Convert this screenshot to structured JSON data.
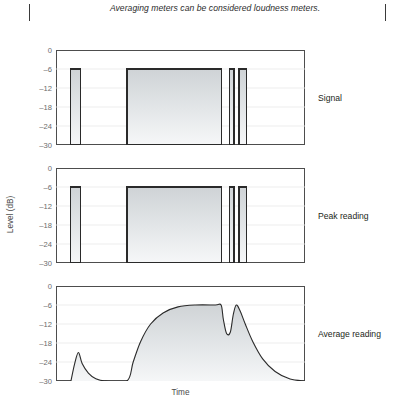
{
  "caption": {
    "text": "Averaging meters can be considered loudness meters."
  },
  "figure": {
    "y_axis_title": "Level (dB)",
    "x_axis_title": "Time",
    "y_ticks": [
      "0",
      "-6",
      "-12",
      "-18",
      "-24",
      "-30"
    ],
    "panels": [
      {
        "id": "signal",
        "label": "Signal"
      },
      {
        "id": "peak",
        "label": "Peak reading"
      },
      {
        "id": "average",
        "label": "Average reading"
      }
    ]
  },
  "colors": {
    "frame": "#4d4d4d",
    "gridline": "#e8e8e8",
    "fill_top": "#cfd3d6",
    "fill_bottom": "#f6f7f8",
    "curve": "#2a2a2a",
    "tick_text": "#6b6b6b",
    "label_text": "#231f20"
  },
  "chart_data": [
    {
      "type": "area",
      "title": "Signal",
      "xlabel": "Time",
      "ylabel": "Level (dB)",
      "ylim": [
        -30,
        0
      ],
      "yticks": [
        0,
        -6,
        -12,
        -18,
        -24,
        -30
      ],
      "grid": true,
      "legend": "none",
      "note": "Rectangular signal bursts all at -6 dB, drawn as blocks from the -30 dB baseline.",
      "blocks": [
        {
          "x_start": 0.06,
          "x_end": 0.1,
          "level_db": -6
        },
        {
          "x_start": 0.285,
          "x_end": 0.665,
          "level_db": -6
        },
        {
          "x_start": 0.695,
          "x_end": 0.715,
          "level_db": -6
        },
        {
          "x_start": 0.735,
          "x_end": 0.765,
          "level_db": -6
        }
      ]
    },
    {
      "type": "area",
      "title": "Peak reading",
      "xlabel": "Time",
      "ylabel": "Level (dB)",
      "ylim": [
        -30,
        0
      ],
      "yticks": [
        0,
        -6,
        -12,
        -18,
        -24,
        -30
      ],
      "grid": true,
      "legend": "none",
      "note": "Peak meter tracks the signal exactly: same blocks at -6 dB.",
      "blocks": [
        {
          "x_start": 0.06,
          "x_end": 0.1,
          "level_db": -6
        },
        {
          "x_start": 0.285,
          "x_end": 0.665,
          "level_db": -6
        },
        {
          "x_start": 0.695,
          "x_end": 0.715,
          "level_db": -6
        },
        {
          "x_start": 0.735,
          "x_end": 0.765,
          "level_db": -6
        }
      ]
    },
    {
      "type": "area",
      "title": "Average reading",
      "xlabel": "Time",
      "ylabel": "Level (dB)",
      "ylim": [
        -30,
        0
      ],
      "yticks": [
        0,
        -6,
        -12,
        -18,
        -24,
        -30
      ],
      "grid": true,
      "legend": "none",
      "note": "Averaging meter: smooth attack/decay envelope. Short burst only reaches about -21 dB; long burst settles at -6 dB; brief dip to about -15 dB between the last bursts, then a slow decay to -30 dB.",
      "x": [
        0.06,
        0.075,
        0.09,
        0.105,
        0.13,
        0.16,
        0.2,
        0.285,
        0.31,
        0.34,
        0.38,
        0.43,
        0.49,
        0.56,
        0.64,
        0.663,
        0.672,
        0.685,
        0.7,
        0.712,
        0.724,
        0.74,
        0.76,
        0.79,
        0.83,
        0.88,
        0.94,
        1.0
      ],
      "y": [
        -30.0,
        -24.5,
        -21.0,
        -24.5,
        -27.5,
        -29.3,
        -30.0,
        -30.0,
        -24.0,
        -17.5,
        -12.0,
        -8.5,
        -6.6,
        -6.0,
        -6.0,
        -6.0,
        -10.5,
        -15.0,
        -14.6,
        -9.0,
        -6.0,
        -8.0,
        -12.0,
        -17.5,
        -23.0,
        -27.0,
        -29.4,
        -30.0
      ]
    }
  ]
}
